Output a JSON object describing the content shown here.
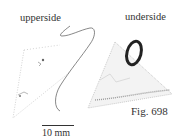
{
  "figure": {
    "labels": {
      "upperside": "upperside",
      "underside": "underside",
      "figure_number": "Fig. 698",
      "scale": "10 mm"
    },
    "colors": {
      "ink": "#333333",
      "stipple": "#9a9a9a",
      "background": "#ffffff"
    }
  }
}
